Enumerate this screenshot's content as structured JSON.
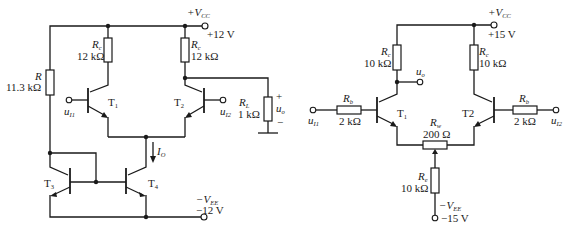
{
  "left_circuit": {
    "vcc": {
      "label": "+V",
      "sub": "CC",
      "value": "+12 V"
    },
    "vee": {
      "label": "−V",
      "sub": "EE",
      "value": "−12 V"
    },
    "rc1": {
      "name": "R",
      "sub": "c",
      "value": "12 kΩ"
    },
    "rc2": {
      "name": "R",
      "sub": "c",
      "value": "12 kΩ"
    },
    "r": {
      "name": "R",
      "value": "11.3 kΩ"
    },
    "rl": {
      "name": "R",
      "sub": "L",
      "value": "1 kΩ"
    },
    "output": {
      "name": "u",
      "sub": "o",
      "plus": "+",
      "minus": "−"
    },
    "input1": {
      "name": "u",
      "sub": "I1"
    },
    "input2": {
      "name": "u",
      "sub": "I2"
    },
    "current": {
      "name": "I",
      "sub": "O"
    },
    "transistors": [
      {
        "name": "T",
        "sub": "1"
      },
      {
        "name": "T",
        "sub": "2"
      },
      {
        "name": "T",
        "sub": "3"
      },
      {
        "name": "T",
        "sub": "4"
      }
    ]
  },
  "right_circuit": {
    "vcc": {
      "label": "+V",
      "sub": "CC",
      "value": "+15 V"
    },
    "vee": {
      "label": "−V",
      "sub": "EE",
      "value": "−15 V"
    },
    "rc1": {
      "name": "R",
      "sub": "c",
      "value": "10 kΩ"
    },
    "rc2": {
      "name": "R",
      "sub": "c",
      "value": "10 kΩ"
    },
    "rb1": {
      "name": "R",
      "sub": "b",
      "value": "2 kΩ"
    },
    "rb2": {
      "name": "R",
      "sub": "b",
      "value": "2 kΩ"
    },
    "rw": {
      "name": "R",
      "sub": "w",
      "value": "200 Ω"
    },
    "re": {
      "name": "R",
      "sub": "e",
      "value": "10 kΩ"
    },
    "output": {
      "name": "u",
      "sub": "o"
    },
    "input1": {
      "name": "u",
      "sub": "I1"
    },
    "input2": {
      "name": "u",
      "sub": "I2"
    },
    "transistors": [
      {
        "name": "T",
        "sub": "1"
      },
      {
        "name": "T2",
        "sub": ""
      }
    ]
  }
}
